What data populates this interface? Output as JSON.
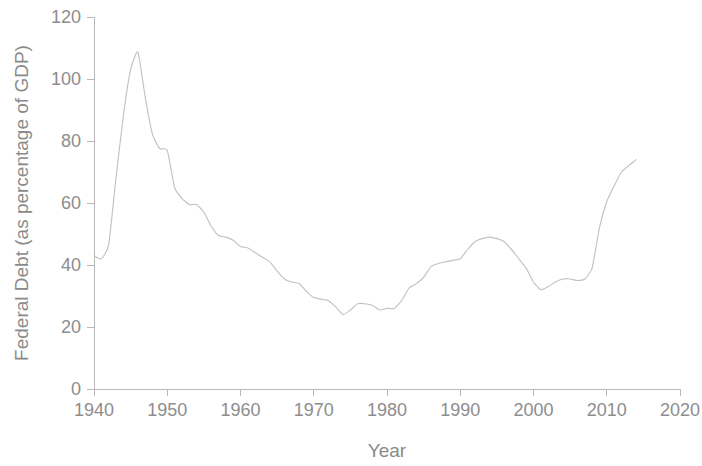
{
  "chart_data": {
    "type": "line",
    "title": "",
    "xlabel": "Year",
    "ylabel": "Federal Debt (as percentage of GDP)",
    "xlim": [
      1940,
      2020
    ],
    "ylim": [
      0,
      120
    ],
    "xticks": [
      1940,
      1950,
      1960,
      1970,
      1980,
      1990,
      2000,
      2010,
      2020
    ],
    "xtick_labels": [
      "1940",
      "1950",
      "1960",
      "1970",
      "1980",
      "1990",
      "2000",
      "2010",
      "2020"
    ],
    "yticks": [
      0,
      20,
      40,
      60,
      80,
      100,
      120
    ],
    "ytick_labels": [
      "0",
      "20",
      "40",
      "60",
      "80",
      "100",
      "120"
    ],
    "grid": false,
    "legend": false,
    "line_color": "#c2c2c2",
    "series": [
      {
        "name": "Federal Debt as percentage of GDP",
        "x": [
          1940,
          1941,
          1942,
          1943,
          1944,
          1945,
          1946,
          1947,
          1948,
          1949,
          1950,
          1951,
          1952,
          1953,
          1954,
          1955,
          1956,
          1957,
          1958,
          1959,
          1960,
          1961,
          1962,
          1963,
          1964,
          1965,
          1966,
          1967,
          1968,
          1969,
          1970,
          1971,
          1972,
          1973,
          1974,
          1975,
          1976,
          1977,
          1978,
          1979,
          1980,
          1981,
          1982,
          1983,
          1984,
          1985,
          1986,
          1987,
          1988,
          1989,
          1990,
          1991,
          1992,
          1993,
          1994,
          1995,
          1996,
          1997,
          1998,
          1999,
          2000,
          2001,
          2002,
          2003,
          2004,
          2005,
          2006,
          2007,
          2008,
          2009,
          2010,
          2011,
          2012,
          2013,
          2014
        ],
        "y": [
          43.0,
          42.0,
          46.5,
          68.0,
          88.0,
          103.0,
          108.7,
          94.0,
          82.0,
          77.5,
          77.0,
          65.0,
          61.5,
          59.5,
          59.5,
          57.0,
          52.5,
          49.5,
          49.0,
          48.0,
          46.0,
          45.5,
          44.0,
          42.5,
          41.0,
          38.0,
          35.5,
          34.5,
          34.0,
          31.5,
          29.5,
          29.0,
          28.5,
          26.5,
          24.0,
          25.5,
          27.5,
          27.5,
          27.0,
          25.5,
          26.0,
          26.0,
          28.5,
          32.5,
          34.0,
          36.0,
          39.5,
          40.5,
          41.0,
          41.5,
          42.0,
          45.0,
          47.5,
          48.5,
          49.0,
          48.5,
          47.5,
          45.0,
          42.0,
          39.0,
          34.5,
          32.0,
          33.0,
          34.5,
          35.5,
          35.5,
          35.0,
          35.5,
          39.0,
          52.0,
          60.5,
          65.5,
          70.0,
          72.0,
          74.0
        ]
      }
    ]
  },
  "axes": {
    "y_title": "Federal Debt (as percentage of GDP)",
    "x_title": "Year"
  }
}
